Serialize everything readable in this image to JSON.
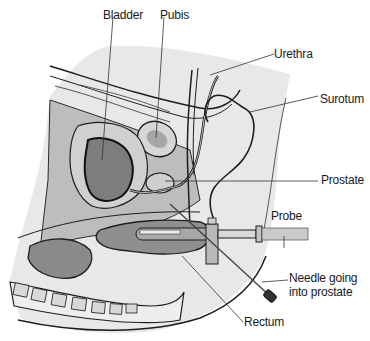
{
  "figure": {
    "colors": {
      "background": "#ffffff",
      "skin_light": "#e6e6e6",
      "tissue_mid": "#bdbdbd",
      "tissue_dark": "#8c8c8c",
      "bladder_fill": "#7a7a7a",
      "outline": "#1e1e1e",
      "label_text": "#1a1a1a"
    }
  },
  "labels": {
    "bladder": "Bladder",
    "pubis": "Pubis",
    "urethra": "Urethra",
    "scrotum": "Surotum",
    "prostate": "Prostate",
    "probe": "Probe",
    "needle_line1": "Needle going",
    "needle_line2": "into prostate",
    "rectum": "Rectum"
  }
}
